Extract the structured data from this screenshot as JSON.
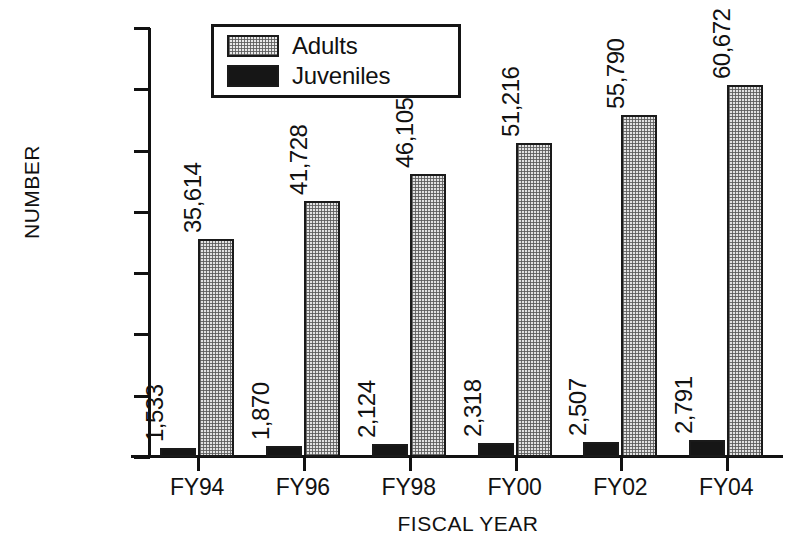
{
  "chart_data": {
    "type": "bar",
    "title": "",
    "subtitle": "",
    "xlabel": "FISCAL YEAR",
    "ylabel": "NUMBER",
    "categories": [
      "FY94",
      "FY96",
      "FY98",
      "FY00",
      "FY02",
      "FY04"
    ],
    "series": [
      {
        "name": "Juveniles",
        "color": "#161616",
        "fill": "solid-black",
        "values": [
          1533,
          1870,
          2124,
          2318,
          2507,
          2791
        ],
        "labels": [
          "1,533",
          "1,870",
          "2,124",
          "2,318",
          "2,507",
          "2,791"
        ]
      },
      {
        "name": "Adults",
        "color": "#e2e2e2",
        "fill": "stipple-gray",
        "values": [
          35614,
          41728,
          46105,
          51216,
          55790,
          60672
        ],
        "labels": [
          "35,614",
          "41,728",
          "46,105",
          "51,216",
          "55,790",
          "60,672"
        ]
      }
    ],
    "ylim": [
      0,
      70000
    ],
    "ytick_values": [
      0,
      10000,
      20000,
      30000,
      40000,
      50000,
      60000,
      70000
    ],
    "ytick_labels": [
      "0",
      "10,000",
      "20,000",
      "30,000",
      "40,000",
      "50,000",
      "60,000",
      "70,000"
    ],
    "grid": false,
    "legend_position": "top-left-inside",
    "legend_entries": [
      "Adults",
      "Juveniles"
    ],
    "data_label_rotation": "90-ccw"
  }
}
